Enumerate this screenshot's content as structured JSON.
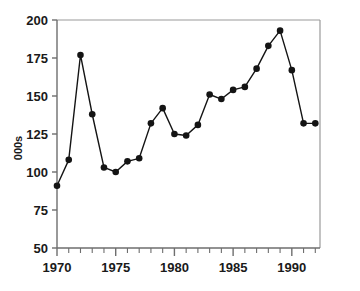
{
  "chart_data": {
    "type": "line",
    "title": "",
    "xlabel": "",
    "ylabel": "000s",
    "x": [
      1970,
      1971,
      1972,
      1973,
      1974,
      1975,
      1976,
      1977,
      1978,
      1979,
      1980,
      1981,
      1982,
      1983,
      1984,
      1985,
      1986,
      1987,
      1988,
      1989,
      1990,
      1991,
      1992
    ],
    "values": [
      91,
      108,
      177,
      138,
      103,
      100,
      107,
      109,
      132,
      142,
      125,
      124,
      131,
      151,
      148,
      154,
      156,
      168,
      183,
      193,
      167,
      132,
      132
    ],
    "series": [
      {
        "name": "000s",
        "values": [
          91,
          108,
          177,
          138,
          103,
          100,
          107,
          109,
          132,
          142,
          125,
          124,
          131,
          151,
          148,
          154,
          156,
          168,
          183,
          193,
          167,
          132,
          132
        ]
      }
    ],
    "xlim": [
      1970,
      1992.4
    ],
    "ylim": [
      50,
      200
    ],
    "y_ticks": [
      50,
      75,
      100,
      125,
      150,
      175,
      200
    ],
    "y_tick_labels": [
      "50",
      "75",
      "100",
      "125",
      "150",
      "175",
      "200"
    ],
    "x_ticks": [
      1970,
      1971,
      1972,
      1973,
      1974,
      1975,
      1976,
      1977,
      1978,
      1979,
      1980,
      1981,
      1982,
      1983,
      1984,
      1985,
      1986,
      1987,
      1988,
      1989,
      1990,
      1991,
      1992
    ],
    "x_major_ticks": [
      1970,
      1975,
      1980,
      1985,
      1990
    ],
    "x_tick_labels": [
      "1970",
      "1975",
      "1980",
      "1985",
      "1990"
    ],
    "grid": false,
    "legend": false,
    "legend_position": "none",
    "marker": "filled-circle",
    "line_color": "#141414",
    "marker_color": "#141414",
    "axis_color": "#6e6e6e",
    "frame_color": "#9a9a9a",
    "background_color": "#ffffff"
  }
}
